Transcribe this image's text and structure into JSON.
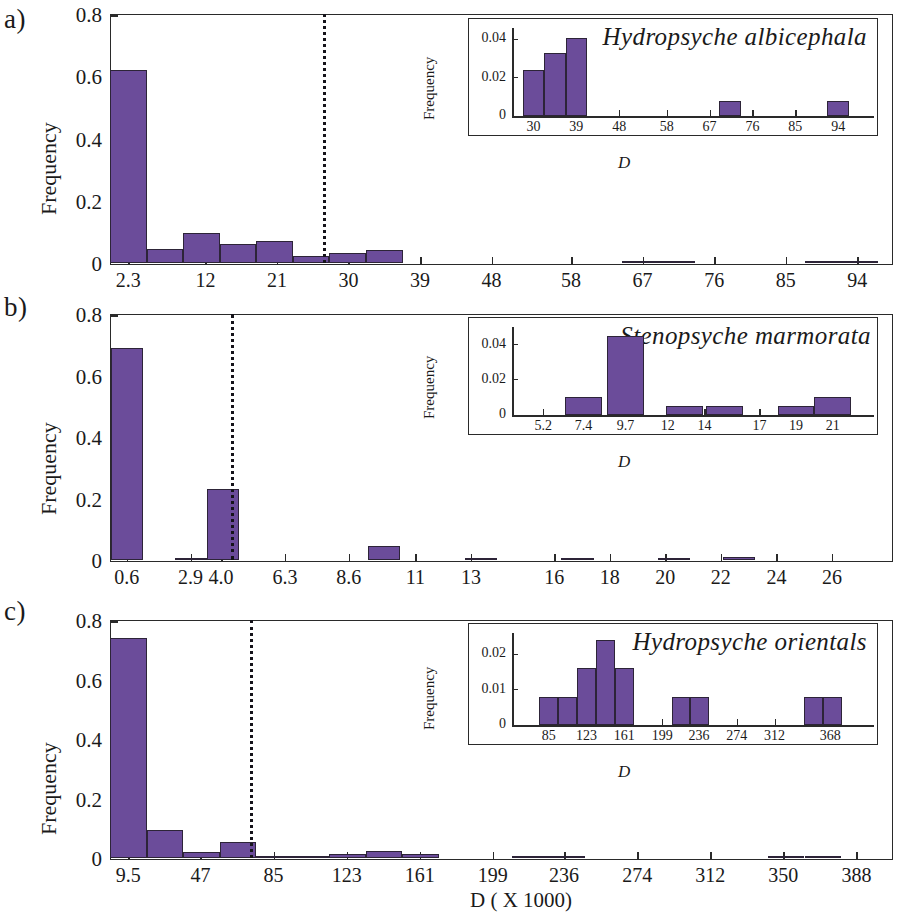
{
  "figure": {
    "xlabel_main": "D ( X 1000)",
    "bar_color": "#6b4c9a",
    "bar_edge_color": "#2d2438",
    "axis_color": "#2a2a2a",
    "threshold_line_style": "dotted"
  },
  "panels": [
    {
      "letter": "a)",
      "chart_data": {
        "type": "bar",
        "title": "",
        "xlabel": "",
        "ylabel": "Frequency",
        "ylim": [
          0,
          0.8
        ],
        "yticks": [
          "0",
          "0.2",
          "0.4",
          "0.6",
          "0.8"
        ],
        "ytick_values": [
          0,
          0.2,
          0.4,
          0.6,
          0.8
        ],
        "xticks": [
          "2.3",
          "12",
          "21",
          "30",
          "39",
          "48",
          "58",
          "67",
          "76",
          "85",
          "94"
        ],
        "xtick_values": [
          2.3,
          12,
          21,
          30,
          39,
          48,
          58,
          67,
          76,
          85,
          94
        ],
        "xlim": [
          0,
          98.5
        ],
        "grid": false,
        "threshold": 26.8,
        "bin_width": 4.6,
        "categories": [
          2.3,
          6.9,
          11.5,
          16.1,
          20.7,
          25.3,
          29.9,
          34.5,
          39.1,
          43.7,
          48.3,
          52.9,
          57.5,
          62.1,
          66.7,
          71.3,
          75.9,
          80.5,
          85.1,
          89.7,
          94.3
        ],
        "values": [
          0.622,
          0.047,
          0.097,
          0.063,
          0.072,
          0.025,
          0.034,
          0.042,
          0.0,
          0.0,
          0.0,
          0.0,
          0.0,
          0.0,
          0.008,
          0.008,
          0.0,
          0.0,
          0.0,
          0.008,
          0.008
        ]
      },
      "inset": {
        "species": "Hydropsyche albicephala",
        "chart_data": {
          "type": "bar",
          "ylabel": "Frequency",
          "xlabel": "D",
          "ylim": [
            0,
            0.046
          ],
          "yticks": [
            "0",
            "0.02",
            "0.04"
          ],
          "ytick_values": [
            0,
            0.02,
            0.04
          ],
          "xticks": [
            "30",
            "39",
            "48",
            "58",
            "67",
            "76",
            "85",
            "94"
          ],
          "xtick_values": [
            30,
            39,
            48,
            58,
            67,
            76,
            85,
            94
          ],
          "xlim": [
            25.5,
            99
          ],
          "grid": false,
          "categories": [
            30,
            34.5,
            39,
            71.3,
            94
          ],
          "values": [
            0.024,
            0.033,
            0.041,
            0.008,
            0.008
          ]
        }
      }
    },
    {
      "letter": "b)",
      "chart_data": {
        "type": "bar",
        "title": "",
        "xlabel": "",
        "ylabel": "Frequency",
        "ylim": [
          0,
          0.8
        ],
        "yticks": [
          "0",
          "0.2",
          "0.4",
          "0.6",
          "0.8"
        ],
        "ytick_values": [
          0,
          0.2,
          0.4,
          0.6,
          0.8
        ],
        "xticks": [
          "0.6",
          "2.9",
          "4.0",
          "6.3",
          "8.6",
          "11",
          "13",
          "16",
          "18",
          "20",
          "22",
          "24",
          "26"
        ],
        "xtick_values": [
          0.6,
          2.9,
          4.0,
          6.3,
          8.6,
          11,
          13,
          16,
          18,
          20,
          22,
          24,
          26
        ],
        "xlim": [
          0,
          28.2
        ],
        "grid": false,
        "threshold": 4.35,
        "bin_width": 1.16,
        "categories": [
          0.6,
          1.76,
          2.92,
          4.08,
          5.24,
          6.4,
          7.56,
          8.72,
          9.88,
          11.04,
          12.2,
          13.36,
          14.52,
          15.68,
          16.84,
          18.0,
          19.16,
          20.32,
          21.48,
          22.64,
          23.8,
          24.96,
          26.12
        ],
        "values": [
          0.69,
          0.0,
          0.006,
          0.233,
          0.0,
          0.0,
          0.0,
          0.0,
          0.047,
          0.0,
          0.0,
          0.005,
          0.0,
          0.0,
          0.005,
          0.0,
          0.0,
          0.005,
          0.0,
          0.01,
          0.0,
          0.0,
          0.0
        ]
      },
      "inset": {
        "species": "Stenopsyche marmorata",
        "chart_data": {
          "type": "bar",
          "ylabel": "Frequency",
          "xlabel": "D",
          "ylim": [
            0,
            0.05
          ],
          "yticks": [
            "0",
            "0.02",
            "0.04"
          ],
          "ytick_values": [
            0,
            0.02,
            0.04
          ],
          "xticks": [
            "5.2",
            "7.4",
            "9.7",
            "12",
            "14",
            "17",
            "19",
            "21"
          ],
          "xtick_values": [
            5.2,
            7.4,
            9.7,
            12,
            14,
            17,
            19,
            21
          ],
          "xlim": [
            3.5,
            22.6
          ],
          "grid": false,
          "categories": [
            7.4,
            9.7,
            12.9,
            15.1,
            19.0,
            21.0
          ],
          "values": [
            0.01,
            0.045,
            0.005,
            0.005,
            0.005,
            0.01
          ]
        }
      }
    },
    {
      "letter": "c)",
      "chart_data": {
        "type": "bar",
        "title": "",
        "xlabel": "",
        "ylabel": "Frequency",
        "ylim": [
          0,
          0.8
        ],
        "yticks": [
          "0",
          "0.2",
          "0.4",
          "0.6",
          "0.8"
        ],
        "ytick_values": [
          0,
          0.2,
          0.4,
          0.6,
          0.8
        ],
        "xticks": [
          "9.5",
          "47",
          "85",
          "123",
          "161",
          "199",
          "236",
          "274",
          "312",
          "350",
          "388"
        ],
        "xtick_values": [
          9.5,
          47,
          85,
          123,
          161,
          199,
          236,
          274,
          312,
          350,
          388
        ],
        "xlim": [
          0,
          407
        ],
        "grid": false,
        "threshold": 73,
        "bin_width": 19,
        "categories": [
          9.5,
          28.5,
          47.5,
          66.5,
          85.5,
          104.5,
          123.5,
          142.5,
          161.5,
          180.5,
          199.5,
          218.5,
          237.5,
          256.5,
          275.5,
          294.5,
          313.5,
          332.5,
          351.5,
          370.5,
          389.5
        ],
        "values": [
          0.741,
          0.097,
          0.023,
          0.054,
          0.008,
          0.008,
          0.016,
          0.024,
          0.016,
          0.0,
          0.0,
          0.008,
          0.008,
          0.0,
          0.0,
          0.0,
          0.0,
          0.0,
          0.008,
          0.008,
          0.0
        ]
      },
      "inset": {
        "species": "Hydropsyche orientals",
        "chart_data": {
          "type": "bar",
          "ylabel": "Frequency",
          "xlabel": "D",
          "ylim": [
            0,
            0.026
          ],
          "yticks": [
            "0",
            "0.01",
            "0.02"
          ],
          "ytick_values": [
            0,
            0.01,
            0.02
          ],
          "xticks": [
            "85",
            "123",
            "161",
            "199",
            "236",
            "274",
            "312",
            "368"
          ],
          "xtick_values": [
            85,
            123,
            161,
            199,
            236,
            274,
            312,
            368
          ],
          "xlim": [
            48,
            400
          ],
          "grid": false,
          "categories": [
            85,
            104,
            123,
            142,
            161,
            218,
            237,
            351,
            370
          ],
          "values": [
            0.008,
            0.008,
            0.016,
            0.024,
            0.016,
            0.008,
            0.008,
            0.008,
            0.008
          ]
        }
      }
    }
  ]
}
